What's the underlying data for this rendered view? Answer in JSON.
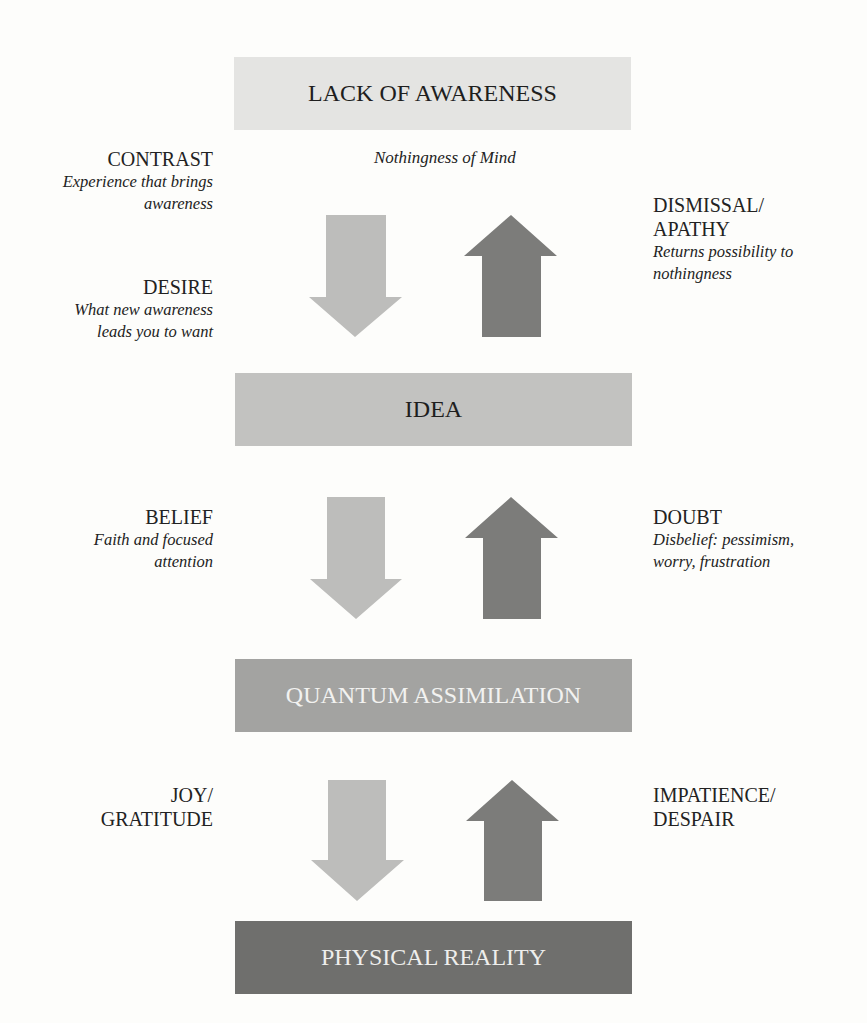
{
  "diagram": {
    "levels": [
      {
        "id": "lack_of_awareness",
        "label": "LACK OF AWARENESS",
        "caption": "Nothingness of Mind",
        "fill": "#e4e4e2"
      },
      {
        "id": "idea",
        "label": "IDEA",
        "fill": "#c2c2c0"
      },
      {
        "id": "quantum_assimilation",
        "label": "QUANTUM ASSIMILATION",
        "fill": "#a3a3a1"
      },
      {
        "id": "physical_reality",
        "label": "PHYSICAL REALITY",
        "fill": "#6f6f6d"
      }
    ],
    "left_labels": [
      {
        "title": "CONTRAST",
        "desc_lines": [
          "Experience that brings",
          "awareness"
        ]
      },
      {
        "title": "DESIRE",
        "desc_lines": [
          "What new awareness",
          "leads you to want"
        ]
      },
      {
        "title": "BELIEF",
        "desc_lines": [
          "Faith and focused",
          "attention"
        ]
      },
      {
        "title_lines": [
          "JOY/",
          "GRATITUDE"
        ]
      }
    ],
    "right_labels": [
      {
        "title_lines": [
          "DISMISSAL/",
          "APATHY"
        ],
        "desc_lines": [
          "Returns possibility to",
          "nothingness"
        ]
      },
      {
        "title": "DOUBT",
        "desc_lines": [
          "Disbelief: pessimism,",
          "worry, frustration"
        ]
      },
      {
        "title_lines": [
          "IMPATIENCE/",
          "DESPAIR"
        ]
      }
    ],
    "arrows": {
      "down_color": "#bdbdbb",
      "up_color": "#7c7c7a",
      "pairs": [
        {
          "between": [
            "lack_of_awareness",
            "idea"
          ]
        },
        {
          "between": [
            "idea",
            "quantum_assimilation"
          ]
        },
        {
          "between": [
            "quantum_assimilation",
            "physical_reality"
          ]
        }
      ]
    }
  }
}
